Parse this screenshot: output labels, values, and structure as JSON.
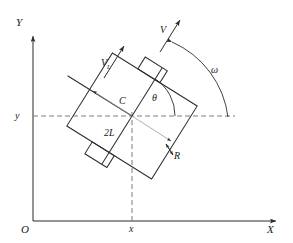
{
  "figure": {
    "type": "kinematics-diagram"
  },
  "axes": {
    "x_axis_label": "X",
    "y_axis_label": "Y",
    "origin_label": "O",
    "x_tick_label": "x",
    "y_tick_label": "y"
  },
  "labels": {
    "center": "C",
    "heading_angle": "θ",
    "angular_velocity": "ω",
    "velocity": "V",
    "left_wheel_velocity_base": "V",
    "left_wheel_velocity_sub": "L",
    "wheel_base": "2L",
    "wheel_radius": "R"
  },
  "colors": {
    "stroke": "#2b2b2b",
    "dashed": "#6e6e6e",
    "background": "#ffffff"
  },
  "geometry": {
    "body_angle_deg": 58,
    "center_point": {
      "x": 132,
      "y": 116
    },
    "axis_origin": {
      "x": 33,
      "y": 221
    }
  }
}
